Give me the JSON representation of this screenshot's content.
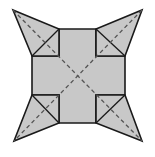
{
  "diagram": {
    "title": "",
    "colors": {
      "background": "#ffffff",
      "fill": "#c8c8c8",
      "stroke": "#1a1a1a",
      "dash": "#555555"
    },
    "center": [
      77,
      77
    ],
    "cross": {
      "outer_left": 32,
      "outer_right": 125,
      "outer_top": 29,
      "outer_bottom": 123,
      "arm_left": 59,
      "arm_right": 96,
      "arm_top": 56,
      "arm_bottom": 95
    },
    "tips": {
      "top_left": [
        13,
        10
      ],
      "top_right": [
        142,
        10
      ],
      "bottom_left": [
        14,
        141
      ],
      "bottom_right": [
        142,
        141
      ]
    }
  }
}
